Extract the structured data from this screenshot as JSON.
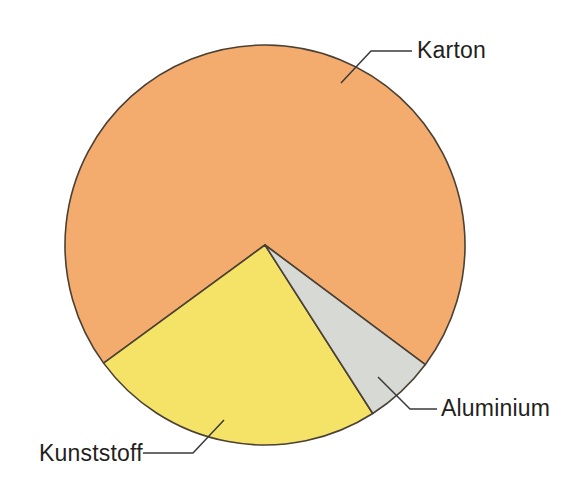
{
  "chart_data": {
    "type": "pie",
    "title": "",
    "subtitle": "",
    "xlabel": "",
    "ylabel": "",
    "legend_position": "none",
    "labels_position": "outside-callout",
    "grid": false,
    "categories": [
      "Karton",
      "Kunststoff",
      "Aluminium"
    ],
    "values": [
      70.3,
      24.0,
      5.7
    ],
    "value_unit": "%",
    "angles_deg": [
      253.3,
      86.4,
      20.7
    ],
    "colors": [
      "#f4ac6e",
      "#f5e368",
      "#d6d9d4"
    ],
    "slices": [
      {
        "label": "Karton",
        "value": 70.3,
        "angle_deg": 253.3,
        "color": "#f4ac6e",
        "start_deg": 143.8,
        "end_deg": 396.7
      },
      {
        "label": "Kunststoff",
        "value": 24.0,
        "angle_deg": 86.4,
        "color": "#f5e368",
        "start_deg": 57.4,
        "end_deg": 143.8
      },
      {
        "label": "Aluminium",
        "value": 5.7,
        "angle_deg": 20.7,
        "color": "#d6d9d4",
        "start_deg": 36.7,
        "end_deg": 57.4
      }
    ],
    "geometry": {
      "center_x": 265,
      "center_y": 245,
      "radius": 200
    }
  },
  "labels": {
    "karton": "Karton",
    "kunststoff": "Kunststoff",
    "aluminium": "Aluminium"
  },
  "colors": {
    "karton_fill": "#f4ac6e",
    "kunststoff_fill": "#f5e368",
    "aluminium_fill": "#d6d9d4",
    "outline": "#4a4034",
    "leader": "#3a3a3a",
    "text": "#231f20",
    "background": "#ffffff"
  }
}
